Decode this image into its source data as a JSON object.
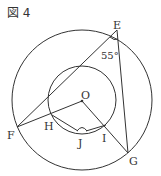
{
  "figure": {
    "title": "図 4"
  },
  "points": {
    "E": {
      "label": "E",
      "x": 117,
      "y": 30
    },
    "F": {
      "label": "F",
      "x": 17,
      "y": 127
    },
    "G": {
      "label": "G",
      "x": 128,
      "y": 153
    },
    "H": {
      "label": "H",
      "x": 52,
      "y": 115
    },
    "I": {
      "label": "I",
      "x": 106,
      "y": 125
    },
    "J": {
      "label": "J",
      "x": 82,
      "y": 133
    },
    "O": {
      "label": "O",
      "x": 82,
      "y": 101
    }
  },
  "circles": {
    "outer": {
      "cx": 82,
      "cy": 100,
      "r": 70
    },
    "inner": {
      "cx": 82,
      "cy": 100,
      "r": 34
    }
  },
  "angle": {
    "at": "E",
    "value": "55°"
  }
}
